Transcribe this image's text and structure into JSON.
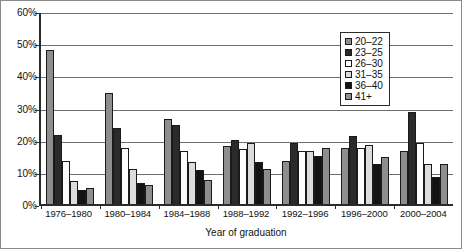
{
  "chart_data": {
    "type": "bar",
    "title": "",
    "xlabel": "Year of graduation",
    "ylabel": "",
    "ylim": [
      0,
      60
    ],
    "yticks": [
      0,
      10,
      20,
      30,
      40,
      50,
      60
    ],
    "ytick_labels": [
      "0%",
      "10%",
      "20%",
      "30%",
      "40%",
      "50%",
      "60%"
    ],
    "grid": true,
    "legend_position": "top-right",
    "categories": [
      "1976–1980",
      "1980–1984",
      "1984–1988",
      "1988–1992",
      "1992–1996",
      "1996–2000",
      "2000–2004"
    ],
    "series": [
      {
        "name": "20–22",
        "color": "#8e8e8e",
        "values": [
          48.0,
          34.5,
          26.5,
          18.0,
          13.5,
          17.5,
          16.5
        ]
      },
      {
        "name": "23–25",
        "color": "#2a2a2a",
        "values": [
          21.5,
          23.5,
          24.5,
          20.0,
          19.0,
          21.0,
          28.5
        ]
      },
      {
        "name": "26–30",
        "color": "#fdfdfd",
        "values": [
          13.5,
          17.5,
          16.5,
          17.0,
          16.5,
          17.5,
          19.0
        ]
      },
      {
        "name": "31–35",
        "color": "#dcdcdc",
        "values": [
          7.0,
          11.0,
          13.0,
          19.0,
          16.5,
          18.5,
          12.5
        ]
      },
      {
        "name": "36–40",
        "color": "#131313",
        "values": [
          4.5,
          6.5,
          10.5,
          13.0,
          15.0,
          12.5,
          8.5
        ]
      },
      {
        "name": "41+",
        "color": "#8e8e8e",
        "values": [
          5.0,
          6.0,
          7.5,
          11.0,
          17.5,
          14.5,
          12.5
        ]
      }
    ]
  }
}
